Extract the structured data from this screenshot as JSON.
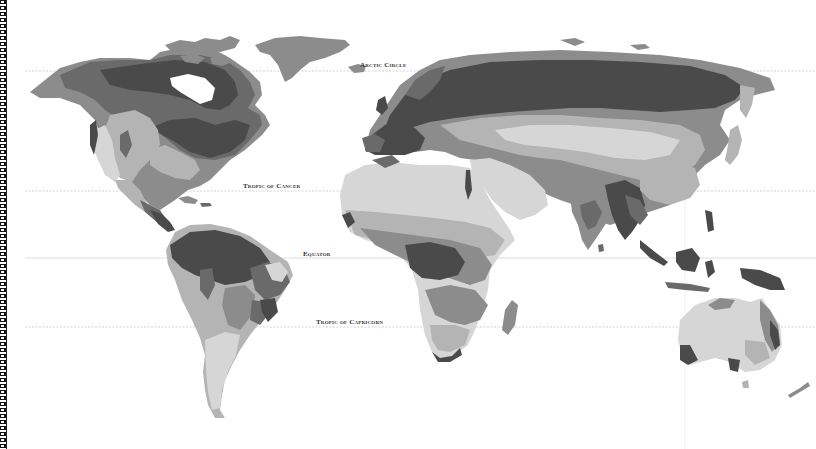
{
  "map": {
    "title": "World climate / vegetation zones map",
    "colors": {
      "background": "#ffffff",
      "zone_darkest": "#4a4a4a",
      "zone_dark": "#6a6a6a",
      "zone_mid": "#8c8c8c",
      "zone_light": "#b4b4b4",
      "zone_lightest": "#d6d6d6",
      "gridline": "#c8c8c8"
    },
    "latitude_lines": [
      {
        "id": "arctic-circle",
        "label": "Arctic Circle",
        "y": 71,
        "label_x": 360,
        "label_y": 61
      },
      {
        "id": "tropic-of-cancer",
        "label": "Tropic of Cancer",
        "y": 191,
        "label_x": 243,
        "label_y": 182
      },
      {
        "id": "equator",
        "label": "Equator",
        "y": 258,
        "label_x": 303,
        "label_y": 250
      },
      {
        "id": "tropic-of-capricorn",
        "label": "Tropic of Capricorn",
        "y": 327,
        "label_x": 316,
        "label_y": 318
      }
    ],
    "meridian_lines": [
      {
        "id": "meridian-right",
        "x": 685
      }
    ]
  }
}
